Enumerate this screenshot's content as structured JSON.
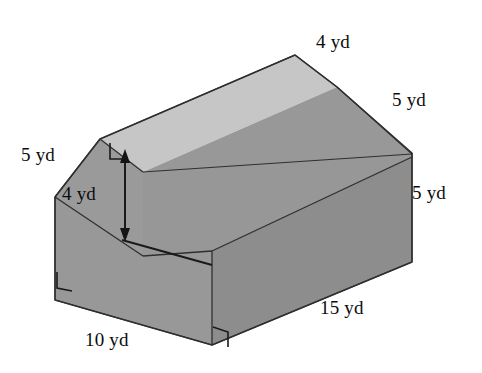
{
  "figure": {
    "name": "barn-shaped-prism",
    "unit": "yd",
    "background_color": "#ffffff",
    "face_colors": {
      "roof_top": "#c6c6c6",
      "roof_slope_right": "#969696",
      "front_wall": "#8e8e8e",
      "left_end": "#9a9a9a",
      "left_slope": "#a2a2a2"
    },
    "outline_color": "#2b2b2b",
    "labels": [
      {
        "id": "top-ridge",
        "text": "4 yd",
        "x": 316,
        "y": 32,
        "edge": "top roof ridge"
      },
      {
        "id": "right-roof-slope",
        "text": "5 yd",
        "x": 392,
        "y": 90,
        "edge": "right roof slope at far end"
      },
      {
        "id": "right-wall",
        "text": "5 yd",
        "x": 412,
        "y": 183,
        "edge": "right vertical wall height"
      },
      {
        "id": "left-roof-slope",
        "text": "5 yd",
        "x": 21,
        "y": 145,
        "edge": "left roof slope on near end"
      },
      {
        "id": "wall-height",
        "text": "4 yd",
        "x": 62,
        "y": 184,
        "edge": "vertical wall height dimension"
      },
      {
        "id": "front-base-depth",
        "text": "10 yd",
        "x": 85,
        "y": 330,
        "edge": "base depth of near end"
      },
      {
        "id": "front-base-length",
        "text": "15 yd",
        "x": 320,
        "y": 298,
        "edge": "base length of prism"
      }
    ],
    "dimension_arrow": {
      "id": "height-arrow",
      "label": "4 yd",
      "value": 4,
      "orientation": "vertical",
      "double_headed": true,
      "from": {
        "x": 125,
        "y": 153
      },
      "to": {
        "x": 125,
        "y": 238
      }
    },
    "right_angle_markers": [
      {
        "id": "ra-top-ridge",
        "x": 110,
        "y": 148
      },
      {
        "id": "ra-bottom-left",
        "x": 57,
        "y": 277
      },
      {
        "id": "ra-bottom-front",
        "x": 213,
        "y": 332
      }
    ]
  }
}
